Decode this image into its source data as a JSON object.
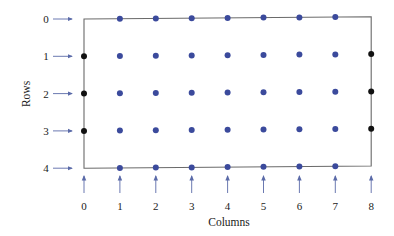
{
  "diagram": {
    "x_axis_title": "Columns",
    "y_axis_title": "Rows",
    "row_labels": [
      "0",
      "1",
      "2",
      "3",
      "4"
    ],
    "column_labels": [
      "0",
      "1",
      "2",
      "3",
      "4",
      "5",
      "6",
      "7",
      "8"
    ],
    "colors": {
      "interior_dot": "#3b4a9c",
      "boundary_dot": "#111111",
      "frame": "#6a6a6a",
      "arrow": "#5a6aa8",
      "text": "#222222"
    },
    "grid": {
      "rows": 5,
      "columns": 9,
      "boundary_points": [
        {
          "row": 1,
          "col": 0
        },
        {
          "row": 2,
          "col": 0
        },
        {
          "row": 3,
          "col": 0
        },
        {
          "row": 1,
          "col": 8
        },
        {
          "row": 2,
          "col": 8
        },
        {
          "row": 3,
          "col": 8
        }
      ],
      "interior_points_description": "Blue dots at every (row, col) for rows 0-4 and columns 1-7",
      "frame_corners_empty": true
    }
  }
}
